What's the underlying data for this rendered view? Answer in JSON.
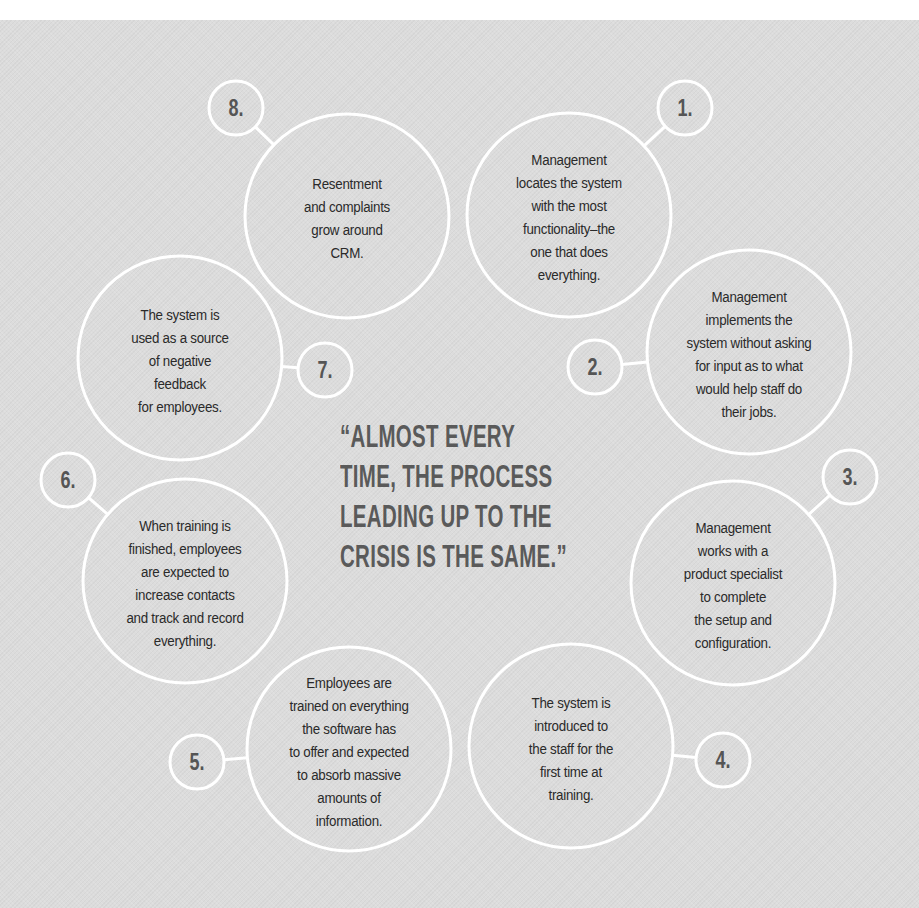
{
  "colors": {
    "background": "#dcdcdc",
    "ring": "#ffffff",
    "body_text": "#2a2a2a",
    "number_text": "#555555",
    "quote_text": "#5a5a5a"
  },
  "quote": {
    "lines": [
      "“ALMOST EVERY",
      "TIME, THE PROCESS",
      "LEADING UP TO THE",
      "CRISIS IS THE SAME.”"
    ]
  },
  "steps": [
    {
      "number": "1.",
      "lines": [
        "Management",
        "locates the system",
        "with the most",
        "functionality–the",
        "one that does",
        "everything."
      ],
      "big": {
        "cx": 569,
        "cy": 215,
        "r": 102
      },
      "small": {
        "cx": 685,
        "cy": 108,
        "r": 27
      }
    },
    {
      "number": "2.",
      "lines": [
        "Management",
        "implements the",
        "system without asking",
        "for input as to what",
        "would help staff do",
        "their jobs."
      ],
      "big": {
        "cx": 749,
        "cy": 352,
        "r": 102
      },
      "small": {
        "cx": 595,
        "cy": 367,
        "r": 27
      }
    },
    {
      "number": "3.",
      "lines": [
        "Management",
        "works with a",
        "product specialist",
        "to complete",
        "the setup and",
        "configuration."
      ],
      "big": {
        "cx": 733,
        "cy": 583,
        "r": 102
      },
      "small": {
        "cx": 850,
        "cy": 477,
        "r": 27
      }
    },
    {
      "number": "4.",
      "lines": [
        "The system is",
        "introduced to",
        "the staff for the",
        "first time at",
        "training."
      ],
      "big": {
        "cx": 571,
        "cy": 746,
        "r": 102
      },
      "small": {
        "cx": 723,
        "cy": 760,
        "r": 27
      }
    },
    {
      "number": "5.",
      "lines": [
        "Employees are",
        "trained on everything",
        "the software has",
        "to offer and expected",
        "to absorb massive",
        "amounts of",
        "information."
      ],
      "big": {
        "cx": 349,
        "cy": 749,
        "r": 102
      },
      "small": {
        "cx": 197,
        "cy": 762,
        "r": 27
      }
    },
    {
      "number": "6.",
      "lines": [
        "When training is",
        "finished, employees",
        "are expected to",
        "increase contacts",
        "and track and record",
        "everything."
      ],
      "big": {
        "cx": 185,
        "cy": 581,
        "r": 102
      },
      "small": {
        "cx": 68,
        "cy": 480,
        "r": 27
      }
    },
    {
      "number": "7.",
      "lines": [
        "The system is",
        "used as a source",
        "of negative",
        "feedback",
        "for employees."
      ],
      "big": {
        "cx": 180,
        "cy": 358,
        "r": 102
      },
      "small": {
        "cx": 325,
        "cy": 370,
        "r": 27
      }
    },
    {
      "number": "8.",
      "lines": [
        "Resentment",
        "and complaints",
        "grow around",
        "CRM."
      ],
      "big": {
        "cx": 347,
        "cy": 216,
        "r": 102
      },
      "small": {
        "cx": 236,
        "cy": 108,
        "r": 27
      }
    }
  ]
}
